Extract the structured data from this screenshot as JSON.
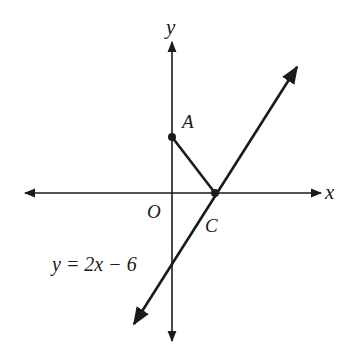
{
  "diagram": {
    "type": "coordinate-plane",
    "axes": {
      "x_label": "x",
      "y_label": "y",
      "origin_label": "O"
    },
    "points": [
      {
        "label": "A",
        "description": "point on the positive y-axis"
      },
      {
        "label": "C",
        "description": "x-intercept of the line y = 2x - 6"
      }
    ],
    "segments": [
      {
        "from": "A",
        "to": "C"
      }
    ],
    "lines": [
      {
        "equation": "y = 2x − 6",
        "label": "y = 2x − 6"
      }
    ],
    "colors": {
      "stroke": "#1a1a1a",
      "background": "#ffffff"
    }
  }
}
